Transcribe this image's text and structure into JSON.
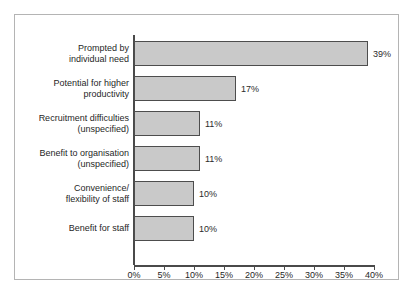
{
  "chart_data": {
    "type": "bar",
    "orientation": "horizontal",
    "title": "",
    "subtitle": "",
    "xlabel": "",
    "ylabel": "",
    "xlim": [
      0,
      40
    ],
    "grid": false,
    "legend": null,
    "categories": [
      "Prompted by\nindividual need",
      "Potential for higher\nproductivity",
      "Recruitment difficulties\n(unspecified)",
      "Benefit to organisation\n(unspecified)",
      "Convenience/\nflexibility of staff",
      "Benefit for staff"
    ],
    "values": [
      39,
      17,
      11,
      11,
      10,
      10
    ],
    "data_labels": [
      "39%",
      "17%",
      "11%",
      "11%",
      "10%",
      "10%"
    ],
    "tick_values": [
      0,
      5,
      10,
      15,
      20,
      25,
      30,
      35,
      40
    ],
    "tick_labels": [
      "0%",
      "5%",
      "10%",
      "15%",
      "20%",
      "25%",
      "30%",
      "35%",
      "40%"
    ],
    "colors": {
      "bar_fill": "#c9c9c9",
      "bar_border": "#4d4d4d",
      "axis": "#4a4a4a",
      "text": "#1f1f1f",
      "frame_border": "#b4b4b4",
      "background": "#ffffff"
    }
  },
  "categories_lines": [
    [
      "Prompted by",
      "individual need"
    ],
    [
      "Potential for higher",
      "productivity"
    ],
    [
      "Recruitment difficulties",
      "(unspecified)"
    ],
    [
      "Benefit to organisation",
      "(unspecified)"
    ],
    [
      "Convenience/",
      "flexibility of staff"
    ],
    [
      "Benefit for staff"
    ]
  ],
  "page_bleed": {
    "text": " "
  }
}
